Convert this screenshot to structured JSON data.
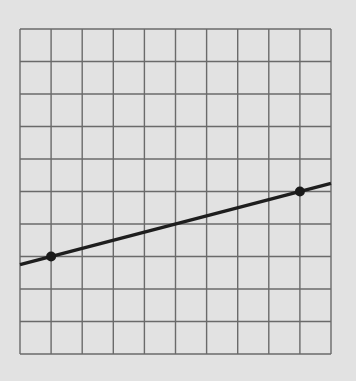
{
  "chart_data": {
    "type": "line",
    "title": "",
    "xlabel": "",
    "ylabel": "",
    "grid": true,
    "xlim": [
      0,
      10
    ],
    "ylim": [
      0,
      10
    ],
    "points": [
      {
        "x": 1,
        "y": 3
      },
      {
        "x": 9,
        "y": 5
      }
    ],
    "line": {
      "slope": 0.25,
      "intercept": 2.75,
      "x_range": [
        0,
        10
      ],
      "y_at_x0": 2.75,
      "y_at_x10": 5.25
    },
    "colors": {
      "background": "#e2e2e2",
      "grid": "#6a6a6a",
      "line": "#1e1e1e",
      "point": "#1a1a1a"
    }
  }
}
